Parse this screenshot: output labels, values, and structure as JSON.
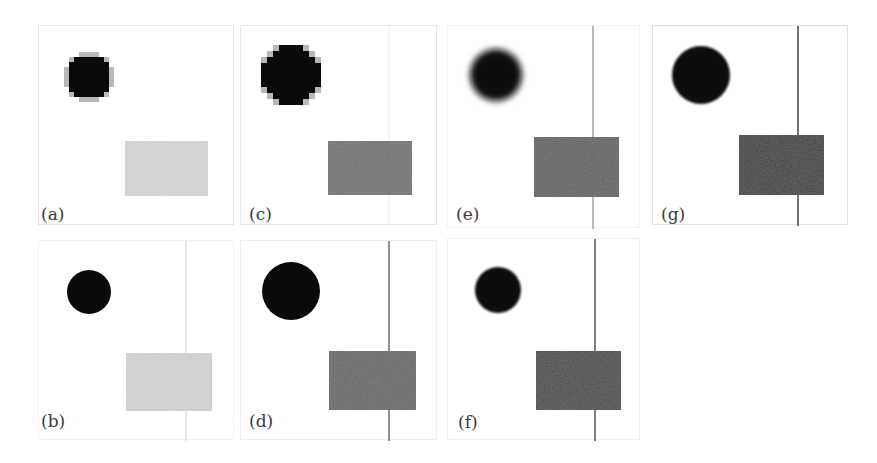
{
  "figure": {
    "panels": [
      {
        "id": "a",
        "label": "(a)",
        "box": {
          "x": 38,
          "y": 25,
          "w": 196,
          "h": 200
        },
        "border": "#e6e6e6",
        "circle": {
          "cx": 50,
          "cy": 51,
          "r": 23,
          "style": "pixelated",
          "color": "#0a0a0a"
        },
        "rect": {
          "x": 86,
          "y": 115,
          "w": 83,
          "h": 55,
          "color": "#d6d6d6"
        },
        "line": null,
        "label_pos": {
          "x": 2,
          "y": 180
        }
      },
      {
        "id": "b",
        "label": "(b)",
        "box": {
          "x": 38,
          "y": 240,
          "w": 196,
          "h": 200
        },
        "border": "#f2f2f2",
        "circle": {
          "cx": 50,
          "cy": 51,
          "r": 22,
          "style": "smooth",
          "color": "#0a0a0a"
        },
        "rect": {
          "x": 87,
          "y": 112,
          "w": 86,
          "h": 58,
          "color": "#d4d4d4"
        },
        "line": {
          "x": 147,
          "color": "#d0d0d0",
          "width": 1
        },
        "label_pos": {
          "x": 2,
          "y": 172
        }
      },
      {
        "id": "c",
        "label": "(c)",
        "box": {
          "x": 240,
          "y": 25,
          "w": 197,
          "h": 200
        },
        "border": "#e6e6e6",
        "circle": {
          "cx": 50,
          "cy": 49,
          "r": 30,
          "style": "pixelated",
          "color": "#0a0a0a"
        },
        "rect": {
          "x": 87,
          "y": 115,
          "w": 84,
          "h": 54,
          "color": "#757575"
        },
        "line": {
          "x": 148,
          "color": "#ececec",
          "width": 1
        },
        "label_pos": {
          "x": 8,
          "y": 180
        }
      },
      {
        "id": "d",
        "label": "(d)",
        "box": {
          "x": 240,
          "y": 240,
          "w": 197,
          "h": 200
        },
        "border": "#eeeeee",
        "circle": {
          "cx": 50,
          "cy": 50,
          "r": 29,
          "style": "smooth",
          "color": "#0a0a0a"
        },
        "rect": {
          "x": 88,
          "y": 110,
          "w": 87,
          "h": 59,
          "color": "#6c6c6c"
        },
        "line": {
          "x": 148,
          "color": "#6a6a6a",
          "width": 1.5
        },
        "label_pos": {
          "x": 8,
          "y": 172
        }
      },
      {
        "id": "e",
        "label": "(e)",
        "box": {
          "x": 447,
          "y": 25,
          "w": 193,
          "h": 203
        },
        "border": "#f4f4f4",
        "circle": {
          "cx": 48,
          "cy": 49,
          "r": 26,
          "style": "blurred",
          "color": "#0a0a0a"
        },
        "rect": {
          "x": 86,
          "y": 111,
          "w": 85,
          "h": 60,
          "color": "#666666"
        },
        "line": {
          "x": 145,
          "color": "#8a8a8a",
          "width": 1.2
        },
        "label_pos": {
          "x": 8,
          "y": 180
        }
      },
      {
        "id": "f",
        "label": "(f)",
        "box": {
          "x": 447,
          "y": 238,
          "w": 193,
          "h": 202
        },
        "border": "#f0f0f0",
        "circle": {
          "cx": 50,
          "cy": 51,
          "r": 23,
          "style": "soft",
          "color": "#0a0a0a"
        },
        "rect": {
          "x": 88,
          "y": 112,
          "w": 85,
          "h": 59,
          "color": "#4f4f4f"
        },
        "line": {
          "x": 147,
          "color": "#555555",
          "width": 1.5
        },
        "label_pos": {
          "x": 10,
          "y": 175
        }
      },
      {
        "id": "g",
        "label": "(g)",
        "box": {
          "x": 652,
          "y": 25,
          "w": 196,
          "h": 200
        },
        "border": "#e2e2e2",
        "circle": {
          "cx": 48,
          "cy": 49,
          "r": 29,
          "style": "soft",
          "color": "#0a0a0a"
        },
        "rect": {
          "x": 86,
          "y": 109,
          "w": 85,
          "h": 60,
          "color": "#444444"
        },
        "line": {
          "x": 145,
          "color": "#444444",
          "width": 1.5
        },
        "label_pos": {
          "x": 8,
          "y": 180
        }
      }
    ]
  }
}
